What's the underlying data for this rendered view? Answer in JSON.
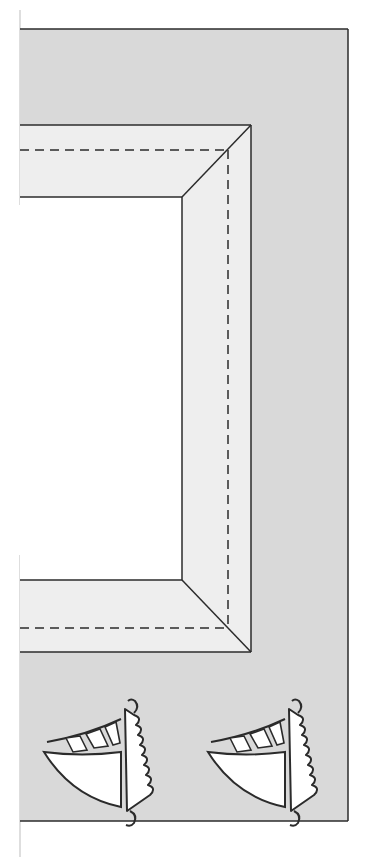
{
  "colors": {
    "page_background": "#ffffff",
    "panel_fill": "#d9d9d9",
    "frame_fill": "#eeeeee",
    "window_fill": "#ffffff",
    "outline": "#2b2b2b",
    "edge_line": "#bdbdbd"
  },
  "illustration": {
    "subject": "craft template: picture frame with dashed fold lines on gray card, two sailboats below",
    "frame": {
      "fold_line_style": "dashed"
    },
    "decorations": [
      {
        "type": "sailboat",
        "label": "sailboat-left"
      },
      {
        "type": "sailboat",
        "label": "sailboat-right"
      }
    ]
  }
}
